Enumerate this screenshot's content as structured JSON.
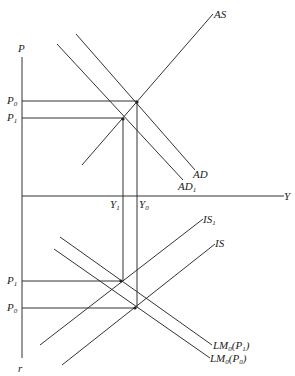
{
  "diagram": {
    "type": "four-quadrant AS-AD / IS-LM diagram",
    "axes": {
      "vertical_top_label": "P",
      "vertical_bottom_label": "r",
      "horizontal_label": "Y"
    },
    "upper_panel": {
      "curves": [
        {
          "name": "AS",
          "label": "AS"
        },
        {
          "name": "AD",
          "label": "AD"
        },
        {
          "name": "AD1",
          "label": "AD",
          "label_sub": "1"
        }
      ],
      "price_levels": [
        {
          "label": "P",
          "sub": "0"
        },
        {
          "label": "P",
          "sub": "1"
        }
      ],
      "output_levels": [
        {
          "label": "Y",
          "sub": "1"
        },
        {
          "label": "Y",
          "sub": "0"
        }
      ]
    },
    "lower_panel": {
      "curves": [
        {
          "name": "IS1",
          "label": "IS",
          "label_sub": "1"
        },
        {
          "name": "IS",
          "label": "IS"
        },
        {
          "name": "LM0(P1)",
          "label": "LM",
          "label_sub": "0",
          "label_arg": "(P",
          "arg_sub": "1",
          "close": ")"
        },
        {
          "name": "LM0(P0)",
          "label": "LM",
          "label_sub": "0",
          "label_arg": "(P",
          "arg_sub": "0",
          "close": ")"
        }
      ],
      "rate_levels": [
        {
          "label": "P",
          "sub": "1"
        },
        {
          "label": "P",
          "sub": "0"
        }
      ]
    }
  }
}
